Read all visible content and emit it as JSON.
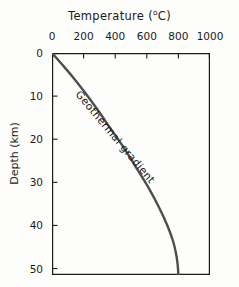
{
  "chart_data": {
    "type": "line",
    "title_text": "Temperature (",
    "title_unit_sup": "o",
    "title_unit_rest": "C)",
    "xlabel": "Temperature (°C)",
    "ylabel": "Depth (km)",
    "xlim": [
      0,
      1000
    ],
    "ylim": [
      0,
      51.5
    ],
    "x_axis_position": "top",
    "y_axis_direction": "inverted",
    "grid": false,
    "legend": "none",
    "xticks": [
      0,
      200,
      400,
      600,
      800,
      1000
    ],
    "xtick_labels": [
      "0",
      "200",
      "400",
      "600",
      "800",
      "1000"
    ],
    "yticks": [
      0,
      10,
      20,
      30,
      40,
      50
    ],
    "ytick_labels": [
      "0",
      "10",
      "20",
      "30",
      "40",
      "50"
    ],
    "series": [
      {
        "name": "Geothermal gradient",
        "annotation": "Geothermal gradient",
        "color": "#4d4d4d",
        "line_width": 2.4,
        "x": [
          0,
          60,
          130,
          205,
          285,
          370,
          455,
          540,
          615,
          680,
          730,
          765,
          785,
          795,
          800
        ],
        "y": [
          0,
          2.5,
          5.5,
          9.0,
          13.0,
          17.5,
          22.0,
          27.0,
          31.5,
          36.0,
          40.0,
          43.5,
          46.5,
          49.0,
          51.5
        ]
      }
    ],
    "axis_color": "#1a1a1a",
    "background": "#fdfdfb"
  },
  "annotations": {
    "curve_label": "Geothermal gradient"
  }
}
